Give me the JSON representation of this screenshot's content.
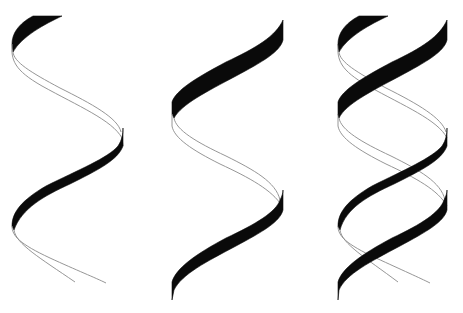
{
  "figure": {
    "colors": {
      "background": "#ffffff",
      "ribbon_front": "#0a0a0a",
      "ribbon_back_edge": "#8a8a8a"
    },
    "panels": [
      {
        "id": "single-helix-a",
        "label": "Single helix (strand A)"
      },
      {
        "id": "single-helix-b",
        "label": "Single helix (strand B)"
      },
      {
        "id": "double-helix",
        "label": "Double helix (strands A + B)"
      }
    ]
  }
}
